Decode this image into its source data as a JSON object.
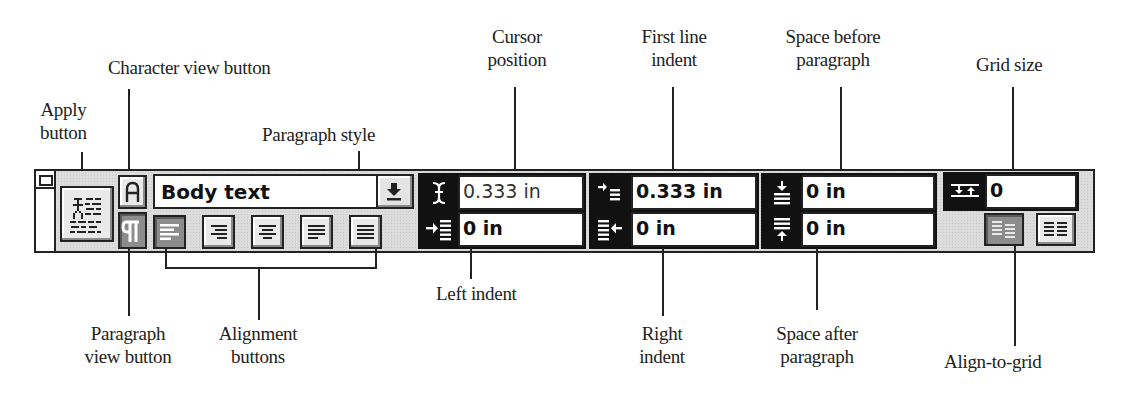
{
  "callouts": {
    "apply_button": "Apply\nbutton",
    "character_view_button": "Character view button",
    "paragraph_style": "Paragraph style",
    "cursor_position": "Cursor\nposition",
    "first_line_indent": "First line\nindent",
    "space_before_paragraph": "Space before\nparagraph",
    "grid_size": "Grid size",
    "paragraph_view_button": "Paragraph\nview button",
    "alignment_buttons": "Alignment\nbuttons",
    "left_indent": "Left indent",
    "right_indent": "Right\nindent",
    "space_after_paragraph": "Space after\nparagraph",
    "align_to_grid": "Align-to-grid"
  },
  "palette": {
    "paragraph_style": {
      "value": "Body text",
      "icon": "down-arrow-icon"
    },
    "view_buttons": [
      {
        "name": "character-view",
        "glyph": "A",
        "pressed": false
      },
      {
        "name": "paragraph-view",
        "glyph": "¶",
        "pressed": true
      }
    ],
    "alignment_buttons": [
      {
        "name": "align-left",
        "pressed": true
      },
      {
        "name": "align-right",
        "pressed": false
      },
      {
        "name": "align-center",
        "pressed": false
      },
      {
        "name": "justify",
        "pressed": false
      },
      {
        "name": "force-justify",
        "pressed": false
      }
    ],
    "cursor_position": {
      "value": "0.333 in",
      "icon": "cursor-position-icon"
    },
    "left_indent": {
      "value": "0 in",
      "icon": "left-indent-icon"
    },
    "first_line_indent": {
      "value": "0.333 in",
      "icon": "first-line-indent-icon"
    },
    "right_indent": {
      "value": "0 in",
      "icon": "right-indent-icon"
    },
    "space_before": {
      "value": "0 in",
      "icon": "space-before-icon"
    },
    "space_after": {
      "value": "0 in",
      "icon": "space-after-icon"
    },
    "grid_size": {
      "value": "0",
      "icon": "grid-size-icon"
    },
    "align_to_grid": [
      {
        "name": "align-to-grid-off",
        "pressed": true
      },
      {
        "name": "align-to-grid-on",
        "pressed": false
      }
    ]
  },
  "colors": {
    "frame": "#222222",
    "panel": "#dcdcdc",
    "field_bg": "#ffffff",
    "icon_bg": "#111111",
    "pressed": "#8c8c8c"
  }
}
